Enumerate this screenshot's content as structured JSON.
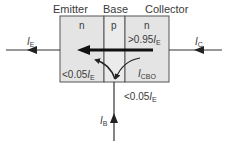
{
  "diagram": {
    "type": "npn-transistor-current-flow",
    "regions": [
      {
        "name": "Emitter",
        "doping": "n"
      },
      {
        "name": "Base",
        "doping": "p"
      },
      {
        "name": "Collector",
        "doping": "n"
      }
    ],
    "currents": {
      "emitter": {
        "symbol": "I",
        "subscript": "E"
      },
      "collector": {
        "symbol": "I",
        "subscript": "C"
      },
      "base": {
        "symbol": "I",
        "subscript": "B"
      },
      "leakage": {
        "symbol": "I",
        "subscript": "CBO"
      }
    },
    "annotations": {
      "main_flow": {
        "prefix": ">0.95",
        "symbol": "I",
        "subscript": "E"
      },
      "recombination": {
        "prefix": "<0.05",
        "symbol": "I",
        "subscript": "E"
      },
      "base_current": {
        "prefix": "<0.05",
        "symbol": "I",
        "subscript": "E"
      }
    },
    "colors": {
      "region_fill": "#e6e6e6",
      "base_fill": "#ececec",
      "outline": "#555555",
      "arrow": "#111111",
      "lead": "#333333"
    }
  }
}
